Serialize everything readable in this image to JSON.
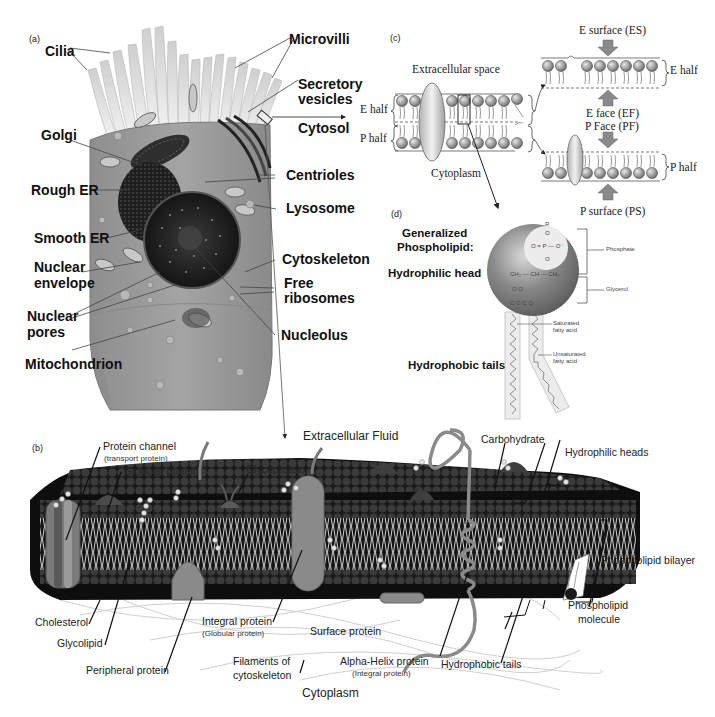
{
  "panels": {
    "a": {
      "tag": "(a)",
      "labels": {
        "cilia": "Cilia",
        "microvilli": "Microvilli",
        "secretory_vesicles_1": "Secretory",
        "secretory_vesicles_2": "vesicles",
        "cytosol": "Cytosol",
        "golgi": "Golgi",
        "centrioles": "Centrioles",
        "rough_er": "Rough ER",
        "lysosome": "Lysosome",
        "smooth_er": "Smooth ER",
        "nuclear_envelope_1": "Nuclear",
        "nuclear_envelope_2": "envelope",
        "cytoskeleton": "Cytoskeleton",
        "free_ribosomes_1": "Free",
        "free_ribosomes_2": "ribosomes",
        "nuclear_pores_1": "Nuclear",
        "nuclear_pores_2": "pores",
        "nucleolus": "Nucleolus",
        "mitochondrion": "Mitochondrion"
      }
    },
    "c": {
      "tag": "(c)",
      "labels": {
        "extracellular_space": "Extracellular space",
        "cytoplasm": "Cytoplasm",
        "e_half_left": "E half",
        "p_half_left": "P half",
        "e_surface": "E surface (ES)",
        "e_half_right": "E half",
        "e_face": "E face (EF)",
        "p_face": "P Face (PF)",
        "p_half_right": "P half",
        "p_surface": "P surface (PS)"
      }
    },
    "d": {
      "tag": "(d)",
      "labels": {
        "generalized_1": "Generalized",
        "generalized_2": "Phospholipid:",
        "hydrophilic_head": "Hydrophilic head",
        "hydrophobic_tails": "Hydrophobic tails",
        "phosphate": "Phosphate",
        "glycerol": "Glycerol",
        "saturated_1": "Saturated",
        "saturated_2": "fatty acid",
        "unsaturated_1": "Unsaturated",
        "unsaturated_2": "fatty acid"
      },
      "chem": {
        "r": "R",
        "o_top": "O",
        "phosphate_row": "O = P — O⁻",
        "o_bottom": "O",
        "glycerol_row": "CH₂ — CH — CH₂",
        "o_row": "O        O",
        "c_row": "C   O C   O"
      }
    },
    "b": {
      "tag": "(b)",
      "labels": {
        "extracellular_fluid": "Extracellular Fluid",
        "protein_channel": "Protein channel",
        "protein_channel_sub": "(transport protein)",
        "globular_protein": "Globular protein",
        "glycoprotein": "Glycoprotein",
        "carbohydrate": "Carbohydrate",
        "hydrophilic_heads": "Hydrophilic heads",
        "phospholipid_bilayer": "Phospholipid bilayer",
        "phospholipid_molecule_1": "Phospholipid",
        "phospholipid_molecule_2": "molecule",
        "cholesterol": "Cholesterol",
        "glycolipid": "Glycolipid",
        "peripheral_protein": "Peripheral protein",
        "integral_protein": "Integral protein",
        "integral_protein_sub": "(Globular protein)",
        "surface_protein": "Surface protein",
        "filaments_1": "Filaments of",
        "filaments_2": "cytoskeleton",
        "alpha_helix": "Alpha-Helix protein",
        "alpha_helix_sub": "(Integral protein)",
        "hydrophobic_tails": "Hydrophobic tails",
        "cytoplasm": "Cytoplasm"
      }
    }
  },
  "colors": {
    "cell_body": "#9a9a9a",
    "cell_dark": "#2a2a2a",
    "membrane_dark": "#141414",
    "protein_gray": "#8c8c8c",
    "sphere_gray": "#7a7a7a",
    "light_fill": "#e6e6e6"
  }
}
